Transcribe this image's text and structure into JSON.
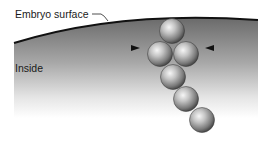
{
  "labels": {
    "surface": "Embryo surface",
    "inside": "Inside"
  },
  "colors": {
    "surface_line": "#111111",
    "interior_top": "#6a6a6a",
    "interior_bottom": "#ffffff",
    "sphere_light": "#f4f4f4",
    "sphere_mid": "#9a9a9a",
    "sphere_dark": "#3a3a3a"
  },
  "spheres": [
    {
      "cx": 172,
      "cy": 31,
      "r": 12.5
    },
    {
      "cx": 160,
      "cy": 54,
      "r": 12.5
    },
    {
      "cx": 186,
      "cy": 54,
      "r": 12.5
    },
    {
      "cx": 173,
      "cy": 77,
      "r": 12.5
    },
    {
      "cx": 186,
      "cy": 99,
      "r": 12.5
    },
    {
      "cx": 202,
      "cy": 120,
      "r": 12.5
    }
  ],
  "arrows": [
    {
      "direction": "right",
      "x": 135,
      "y": 48
    },
    {
      "direction": "left",
      "x": 210,
      "y": 48
    }
  ]
}
